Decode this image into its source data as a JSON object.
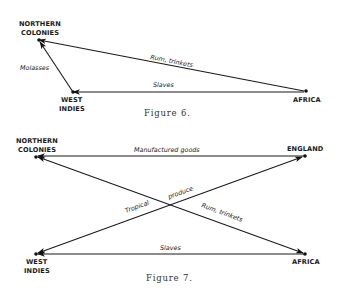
{
  "figures": [
    {
      "caption": "Figure 6.",
      "nodes": {
        "northern_colonies": {
          "line1": "NORTHERN",
          "line2": "COLONIES"
        },
        "west_indies": {
          "line1": "WEST",
          "line2": "INDIES"
        },
        "africa": {
          "line1": "AFRICA"
        }
      },
      "edges": {
        "rum": "Rum, trinkets",
        "slaves": "Slaves",
        "molasses": "Molasses"
      }
    },
    {
      "caption": "Figure 7.",
      "nodes": {
        "northern_colonies": {
          "line1": "NORTHERN",
          "line2": "COLONIES"
        },
        "england": {
          "line1": "ENGLAND"
        },
        "west_indies": {
          "line1": "WEST",
          "line2": "INDIES"
        },
        "africa": {
          "line1": "AFRICA"
        }
      },
      "edges": {
        "manufactured": "Manufactured goods",
        "tropical": "Tropical",
        "produce": "produce",
        "rum": "Rum, trinkets",
        "slaves": "Slaves"
      }
    }
  ],
  "colors": {
    "ink": "#1a1a1a",
    "background": "#ffffff"
  }
}
